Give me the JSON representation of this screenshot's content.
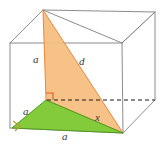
{
  "figure": {
    "type": "geometry-diagram",
    "colors": {
      "orange_fill": "#f6bd7e",
      "orange_edge": "#e8883c",
      "green_fill": "#7dc832",
      "green_edge": "#4e9b1f",
      "cube_edge": "#8c8c8c",
      "hidden_edge": "#1a1a1a",
      "label_text": "#3a3a3a",
      "right_angle_orange": "#e05a20",
      "right_angle_olive": "#b2a233",
      "background": "#ffffff"
    },
    "labels": [
      {
        "id": "edge-a-vertical",
        "text": "a",
        "x": 33,
        "y": 54
      },
      {
        "id": "diagonal-d",
        "text": "d",
        "x": 79,
        "y": 56
      },
      {
        "id": "edge-a-left",
        "text": "a",
        "x": 23,
        "y": 106
      },
      {
        "id": "diagonal-x",
        "text": "x",
        "x": 95,
        "y": 112
      },
      {
        "id": "edge-a-bottom",
        "text": "a",
        "x": 62,
        "y": 131
      }
    ],
    "cube": {
      "front_top_left": [
        43,
        10
      ],
      "front_top_right": [
        122,
        43
      ],
      "back_top_left": [
        10,
        43
      ],
      "back_top_right": [
        155,
        12
      ],
      "front_bottom_left": [
        10,
        128
      ],
      "front_bottom_right": [
        123,
        133
      ],
      "hidden_vertex": [
        48,
        100
      ],
      "hidden_right": [
        155,
        100
      ]
    },
    "orange_triangle": {
      "apex": [
        43,
        10
      ],
      "corner": [
        46,
        100
      ],
      "base": [
        123,
        133
      ]
    },
    "green_triangle": {
      "left": [
        12,
        128
      ],
      "top": [
        46,
        100
      ],
      "right": [
        123,
        133
      ]
    },
    "right_angle_markers": [
      {
        "id": "right-angle-orange",
        "x": 46,
        "y": 100
      },
      {
        "id": "right-angle-olive",
        "x": 14,
        "y": 126
      }
    ]
  }
}
